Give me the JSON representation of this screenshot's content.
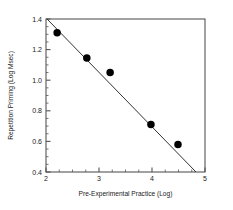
{
  "chart_data": {
    "type": "scatter",
    "title": "",
    "xlabel": "Pre-Experimental Practice (Log)",
    "ylabel": "Repetition Priming (Log Msec)",
    "xlim": [
      2,
      5
    ],
    "ylim": [
      0.4,
      1.4
    ],
    "xticks": [
      2,
      3,
      4,
      5
    ],
    "xtick_labels": [
      "2",
      "3",
      "4",
      "5"
    ],
    "yticks": [
      0.4,
      0.6,
      0.8,
      1.0,
      1.2,
      1.4
    ],
    "ytick_labels": [
      "0.4",
      "0.6",
      "0.8",
      "1.0",
      "1.2",
      "1.4"
    ],
    "x_minor_ticks": [
      2.25,
      2.5,
      2.75,
      3.25,
      3.5,
      3.75,
      4.25,
      4.5,
      4.75
    ],
    "y_minor_ticks": [
      0.45,
      0.5,
      0.55,
      0.65,
      0.7,
      0.75,
      0.85,
      0.9,
      0.95,
      1.05,
      1.1,
      1.15,
      1.25,
      1.3,
      1.35
    ],
    "grid": false,
    "legend": false,
    "series": [
      {
        "name": "Observed data",
        "marker": "circle",
        "marker_color": "#000000",
        "marker_size": 7.5,
        "points": [
          {
            "x": 2.21,
            "y": 1.31
          },
          {
            "x": 2.77,
            "y": 1.145
          },
          {
            "x": 3.21,
            "y": 1.05
          },
          {
            "x": 3.98,
            "y": 0.71
          },
          {
            "x": 4.49,
            "y": 0.58
          }
        ]
      }
    ],
    "fit_line": {
      "name": "Regression line",
      "color": "#333333",
      "width": 1,
      "start": {
        "x": 2.02,
        "y": 1.4
      },
      "end": {
        "x": 4.83,
        "y": 0.4
      }
    },
    "axis_color": "#555555",
    "frame": [
      "left",
      "bottom",
      "top",
      "right"
    ],
    "background": "#ffffff"
  }
}
